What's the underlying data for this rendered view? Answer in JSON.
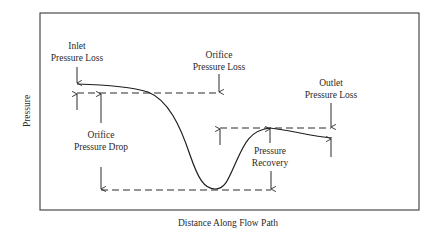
{
  "diagram": {
    "type": "pressure-profile",
    "axes": {
      "x_label": "Distance Along Flow Path",
      "y_label": "Pressure"
    },
    "annotations": {
      "inlet_loss": {
        "line1": "Inlet",
        "line2": "Pressure Loss"
      },
      "orifice_loss": {
        "line1": "Orifice",
        "line2": "Pressure Loss"
      },
      "outlet_loss": {
        "line1": "Outlet",
        "line2": "Pressure Loss"
      },
      "orifice_drop": {
        "line1": "Orifice",
        "line2": "Pressure Drop"
      },
      "recovery": {
        "line1": "Pressure",
        "line2": "Recovery"
      }
    },
    "colors": {
      "line": "#1e1e1e",
      "text": "#2a2a2a",
      "background": "#ffffff"
    }
  }
}
